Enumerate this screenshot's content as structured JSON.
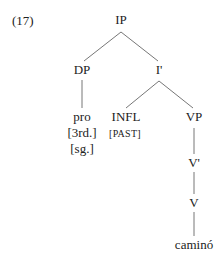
{
  "example_number": "(17)",
  "tree": {
    "IP": "IP",
    "DP": "DP",
    "I_bar": "I'",
    "pro": "pro",
    "pro_person": "[3rd.]",
    "pro_number": "[sg.]",
    "INFL": "INFL",
    "INFL_feature": "[PAST]",
    "VP": "VP",
    "V_bar": "V'",
    "V": "V",
    "verb": "caminó"
  }
}
